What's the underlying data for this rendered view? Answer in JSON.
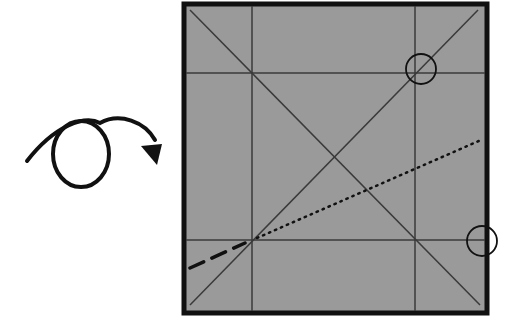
{
  "diagram": {
    "type": "origami-step",
    "instruction_symbol": "turn-over-arrow",
    "paper": {
      "color": "#9a9a9a",
      "border_color": "#111111",
      "crease_color": "#3a3a3a",
      "x": 183,
      "y": 3,
      "width": 304,
      "height": 311
    },
    "creases": [
      {
        "kind": "vertical",
        "x1": 252,
        "y1": 5,
        "x2": 252,
        "y2": 311
      },
      {
        "kind": "vertical",
        "x1": 415,
        "y1": 5,
        "x2": 415,
        "y2": 311
      },
      {
        "kind": "horizontal",
        "x1": 185,
        "y1": 73,
        "x2": 485,
        "y2": 73
      },
      {
        "kind": "horizontal",
        "x1": 185,
        "y1": 240,
        "x2": 485,
        "y2": 240
      },
      {
        "kind": "diagonal",
        "x1": 190,
        "y1": 10,
        "x2": 480,
        "y2": 305
      },
      {
        "kind": "diagonal",
        "x1": 190,
        "y1": 305,
        "x2": 478,
        "y2": 10
      }
    ],
    "valley_fold_line": {
      "style": "dotted",
      "x1": 257,
      "y1": 238,
      "x2": 481,
      "y2": 140
    },
    "extension_line": {
      "style": "dashed",
      "x1": 190,
      "y1": 268,
      "x2": 245,
      "y2": 243
    },
    "reference_circles": [
      {
        "cx": 421,
        "cy": 69,
        "r": 15
      },
      {
        "cx": 482,
        "cy": 241,
        "r": 15
      }
    ]
  }
}
